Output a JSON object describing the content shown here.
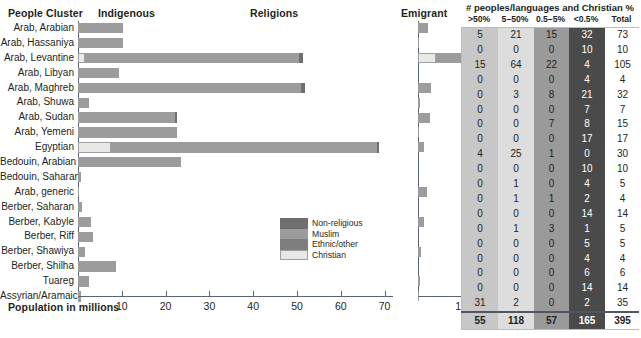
{
  "headers": {
    "people_cluster": "People Cluster",
    "indigenous": "Indigenous",
    "religions": "Religions",
    "emigrant": "Emigrant",
    "axis": "Population in millions"
  },
  "axis": {
    "main_ticks": [
      10,
      20,
      30,
      40,
      50,
      60,
      70
    ],
    "main_max": 72,
    "emigrant_ticks": [
      10
    ],
    "emigrant_max": 13
  },
  "legend": {
    "items": [
      {
        "label": "Non-religious",
        "color": "#6f6f6f"
      },
      {
        "label": "Muslim",
        "color": "#9c9c9c"
      },
      {
        "label": "Ethnic/other",
        "color": "#7e7e7e"
      },
      {
        "label": "Christian",
        "color": "#e8e8e4"
      }
    ]
  },
  "table": {
    "title": "# peoples/languages and Christian %",
    "columns": [
      ">50%",
      "5–50%",
      "0.5–5%",
      "<0.5%",
      "Total"
    ],
    "column_colors": [
      "#c7c7c7",
      "#dddddd",
      "#9a9a9a",
      "#4a4a4a",
      "#ffffff"
    ],
    "totals": [
      55,
      118,
      57,
      165,
      395
    ]
  },
  "chart_data": {
    "type": "bar",
    "xlabel": "Population in millions",
    "ylabel": "People Cluster",
    "xlim": [
      0,
      72
    ],
    "grid": false,
    "legend_position": "inside-bottom-center",
    "categories": [
      "Arab, Arabian",
      "Arab, Hassaniya",
      "Arab, Levantine",
      "Arab, Libyan",
      "Arab, Maghreb",
      "Arab, Shuwa",
      "Arab, Sudan",
      "Arab, Yemeni",
      "Egyptian",
      "Bedouin, Arabian",
      "Bedouin, Saharan",
      "Arab, generic",
      "Berber, Saharan",
      "Berber, Kabyle",
      "Berber, Riff",
      "Berber, Shawiya",
      "Berber, Shilha",
      "Tuareg",
      "Assyrian/Aramaic"
    ],
    "series": [
      {
        "name": "Indigenous — Christian",
        "color": "#e8e8e4",
        "values": [
          0,
          0,
          1.6,
          0,
          0,
          0,
          0.5,
          0,
          7.5,
          0,
          0,
          0,
          0,
          0,
          0,
          0,
          0,
          0,
          0.4
        ]
      },
      {
        "name": "Indigenous — Muslim",
        "color": "#9c9c9c",
        "values": [
          10.2,
          10.2,
          48.8,
          9.3,
          50.8,
          2.6,
          21.6,
          22.5,
          60.8,
          23.6,
          0.6,
          0.2,
          1.0,
          3.0,
          3.5,
          1.7,
          8.7,
          2.4,
          0.1
        ]
      },
      {
        "name": "Indigenous — Non-religious/Ethnic (end cap)",
        "color": "#6f6f6f",
        "values": [
          0,
          0,
          1.0,
          0,
          1.0,
          0,
          0.5,
          0,
          0.4,
          0,
          0,
          0,
          0,
          0,
          0,
          0,
          0,
          0,
          0
        ]
      },
      {
        "name": "Emigrant — Christian",
        "color": "#e8e8e4",
        "values": [
          0,
          0,
          4.2,
          0,
          0,
          0,
          0,
          0,
          0,
          0,
          0,
          0,
          0,
          0,
          0,
          0,
          0,
          0,
          0
        ]
      },
      {
        "name": "Emigrant — Muslim",
        "color": "#9c9c9c",
        "values": [
          2.4,
          0.3,
          8.4,
          0,
          3.1,
          0.4,
          2.8,
          0.2,
          1.3,
          0,
          0,
          2.1,
          0,
          1.4,
          0,
          0.7,
          0,
          0.5,
          0.3
        ]
      }
    ],
    "table_rows": [
      {
        "label": "Arab, Arabian",
        "values": [
          5,
          21,
          15,
          32,
          73
        ]
      },
      {
        "label": "Arab, Hassaniya",
        "values": [
          0,
          0,
          0,
          10,
          10
        ]
      },
      {
        "label": "Arab, Levantine",
        "values": [
          15,
          64,
          22,
          4,
          105
        ]
      },
      {
        "label": "Arab, Libyan",
        "values": [
          0,
          0,
          0,
          4,
          4
        ]
      },
      {
        "label": "Arab, Maghreb",
        "values": [
          0,
          3,
          8,
          21,
          32
        ]
      },
      {
        "label": "Arab, Shuwa",
        "values": [
          0,
          0,
          0,
          7,
          7
        ]
      },
      {
        "label": "Arab, Sudan",
        "values": [
          0,
          0,
          7,
          8,
          15
        ]
      },
      {
        "label": "Arab, Yemeni",
        "values": [
          0,
          0,
          0,
          17,
          17
        ]
      },
      {
        "label": "Egyptian",
        "values": [
          4,
          25,
          1,
          0,
          30
        ]
      },
      {
        "label": "Bedouin, Arabian",
        "values": [
          0,
          0,
          0,
          10,
          10
        ]
      },
      {
        "label": "Bedouin, Saharan",
        "values": [
          0,
          1,
          0,
          4,
          5
        ]
      },
      {
        "label": "Arab, generic",
        "values": [
          0,
          1,
          1,
          2,
          4
        ]
      },
      {
        "label": "Berber, Saharan",
        "values": [
          0,
          0,
          0,
          14,
          14
        ]
      },
      {
        "label": "Berber, Kabyle",
        "values": [
          0,
          1,
          3,
          1,
          5
        ]
      },
      {
        "label": "Berber, Riff",
        "values": [
          0,
          0,
          0,
          5,
          5
        ]
      },
      {
        "label": "Berber, Shawiya",
        "values": [
          0,
          0,
          0,
          4,
          4
        ]
      },
      {
        "label": "Berber, Shilha",
        "values": [
          0,
          0,
          0,
          6,
          6
        ]
      },
      {
        "label": "Tuareg",
        "values": [
          0,
          0,
          0,
          14,
          14
        ]
      },
      {
        "label": "Assyrian/Aramaic",
        "values": [
          31,
          2,
          0,
          2,
          35
        ]
      }
    ]
  }
}
